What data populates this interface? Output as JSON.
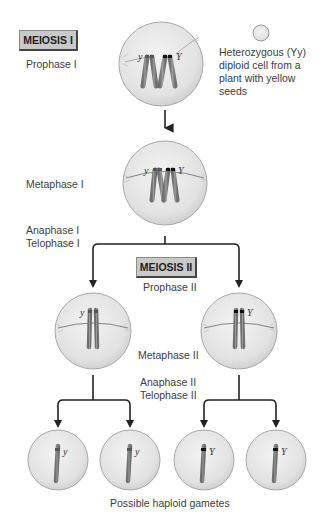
{
  "stages": {
    "meiosis1": {
      "title": "MEIOSIS I"
    },
    "meiosis2": {
      "title": "MEIOSIS II"
    }
  },
  "labels": {
    "prophase1": "Prophase I",
    "metaphase1": "Metaphase I",
    "anaphase1": "Anaphase I",
    "telophase1": "Telophase I",
    "prophase2": "Prophase II",
    "metaphase2": "Metaphase II",
    "anaphase2": "Anaphase II",
    "telophase2": "Telophase II",
    "gametes": "Possible haploid gametes"
  },
  "legend": {
    "line1": "Heterozygous (Yy)",
    "line2": "diploid cell from a",
    "line3": "plant with yellow",
    "line4": "seeds"
  },
  "alleles": {
    "recessive": "y",
    "dominant": "Y"
  },
  "colors": {
    "cell_fill": "#e4e4e4",
    "cell_stroke": "#a8a8a8",
    "chromosome": "#8a8a8a",
    "allele_band_dark": "#111111",
    "allele_band_light": "#5a5a5a",
    "arrow": "#222222",
    "box_fill": "#c9c9c9"
  }
}
